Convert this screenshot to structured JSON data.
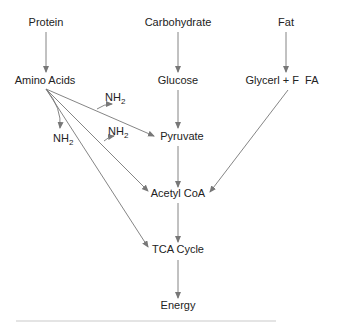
{
  "diagram": {
    "type": "metabolic-pathway-flowchart",
    "nodes": {
      "protein": "Protein",
      "carbohydrate": "Carbohydrate",
      "fat": "Fat",
      "amino_acids": "Amino Acids",
      "glucose": "Glucose",
      "glycerol_fa": "Glycerl + F  FA",
      "pyruvate": "Pyruvate",
      "acetyl_coa": "Acetyl CoA",
      "tca_cycle": "TCA Cycle",
      "energy": "Energy"
    },
    "nh2_label": {
      "base": "NH",
      "sub": "2"
    },
    "edges": [
      {
        "from": "Protein",
        "to": "Amino Acids"
      },
      {
        "from": "Carbohydrate",
        "to": "Glucose"
      },
      {
        "from": "Fat",
        "to": "Glycerl + F  FA"
      },
      {
        "from": "Glucose",
        "to": "Pyruvate"
      },
      {
        "from": "Amino Acids",
        "to": "Pyruvate",
        "releases": "NH2"
      },
      {
        "from": "Amino Acids",
        "to": "Acetyl CoA",
        "releases": "NH2"
      },
      {
        "from": "Amino Acids",
        "to": "TCA Cycle"
      },
      {
        "from": "Amino Acids",
        "to": "NH2"
      },
      {
        "from": "Pyruvate",
        "to": "Acetyl CoA"
      },
      {
        "from": "Glycerl + F  FA",
        "to": "Acetyl CoA"
      },
      {
        "from": "Acetyl CoA",
        "to": "TCA Cycle"
      },
      {
        "from": "TCA Cycle",
        "to": "Energy"
      }
    ],
    "colors": {
      "line": "#777777",
      "text": "#222222",
      "background": "#ffffff"
    }
  }
}
